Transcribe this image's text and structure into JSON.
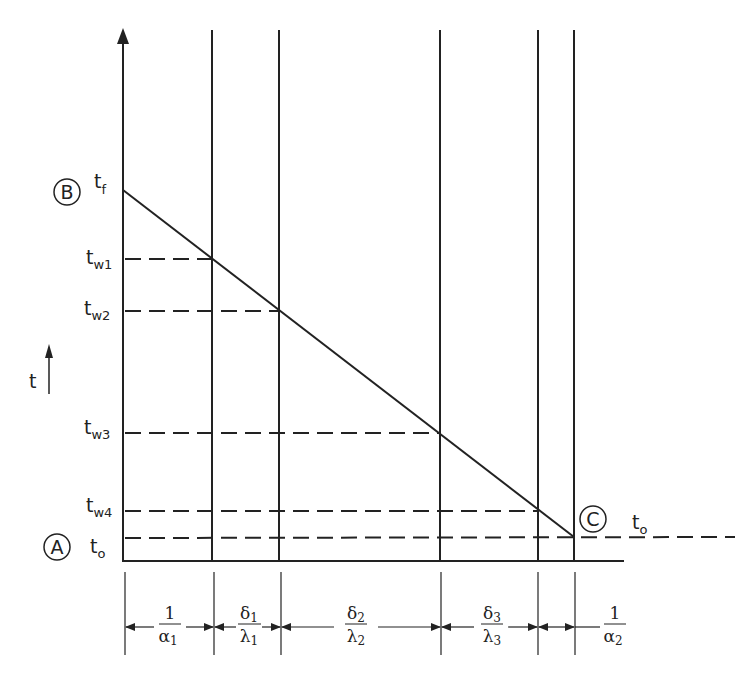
{
  "diagram": {
    "axis_label": "t",
    "points": [
      {
        "id": "B",
        "label": "B"
      },
      {
        "id": "A",
        "label": "A"
      },
      {
        "id": "C",
        "label": "C"
      }
    ],
    "temperatures": [
      {
        "main": "t",
        "sub": "f"
      },
      {
        "main": "t",
        "sub": "w1"
      },
      {
        "main": "t",
        "sub": "w2"
      },
      {
        "main": "t",
        "sub": "w3"
      },
      {
        "main": "t",
        "sub": "w4"
      },
      {
        "main": "t",
        "sub": "o"
      }
    ],
    "right_label": {
      "main": "t",
      "sub": "o"
    },
    "resistances": [
      {
        "num": "1",
        "den": "α",
        "den_sub": "1"
      },
      {
        "num": "δ",
        "num_sub": "1",
        "den": "λ",
        "den_sub": "1"
      },
      {
        "num": "δ",
        "num_sub": "2",
        "den": "λ",
        "den_sub": "2"
      },
      {
        "num": "δ",
        "num_sub": "3",
        "den": "λ",
        "den_sub": "3"
      },
      {
        "num": "1",
        "den": "α",
        "den_sub": "2"
      }
    ]
  }
}
